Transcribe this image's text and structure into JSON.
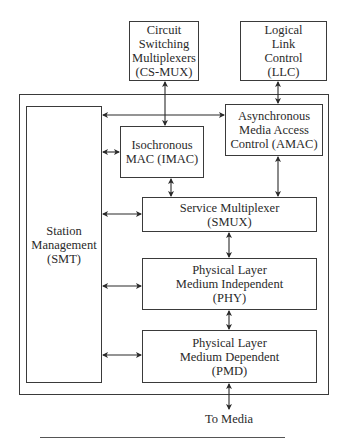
{
  "diagram": {
    "type": "block-diagram",
    "title": "",
    "external_blocks": [
      {
        "id": "cs-mux",
        "label": "Circuit\nSwitching\nMultiplexers\n(CS-MUX)"
      },
      {
        "id": "llc",
        "label": "Logical\nLink\nControl\n(LLC)"
      }
    ],
    "blocks": [
      {
        "id": "smt",
        "label": "Station\nManagement\n(SMT)"
      },
      {
        "id": "amac",
        "label": "Asynchronous\nMedia Access\nControl (AMAC)"
      },
      {
        "id": "imac",
        "label": "Isochronous\nMAC (IMAC)"
      },
      {
        "id": "smux",
        "label": "Service Multiplexer\n(SMUX)"
      },
      {
        "id": "phy",
        "label": "Physical Layer\nMedium Independent\n(PHY)"
      },
      {
        "id": "pmd",
        "label": "Physical Layer\nMedium Dependent\n(PMD)"
      }
    ],
    "output_label": "To Media",
    "connections": [
      {
        "from": "cs-mux",
        "to": "imac",
        "style": "bidirectional"
      },
      {
        "from": "llc",
        "to": "amac",
        "style": "bidirectional"
      },
      {
        "from": "smt",
        "to": "amac",
        "style": "bidirectional"
      },
      {
        "from": "smt",
        "to": "imac",
        "style": "bidirectional"
      },
      {
        "from": "imac",
        "to": "smux",
        "style": "bidirectional"
      },
      {
        "from": "amac",
        "to": "smux",
        "style": "bidirectional"
      },
      {
        "from": "smt",
        "to": "smux",
        "style": "bidirectional"
      },
      {
        "from": "smux",
        "to": "phy",
        "style": "bidirectional"
      },
      {
        "from": "smt",
        "to": "phy",
        "style": "bidirectional"
      },
      {
        "from": "phy",
        "to": "pmd",
        "style": "bidirectional"
      },
      {
        "from": "smt",
        "to": "pmd",
        "style": "bidirectional"
      },
      {
        "from": "pmd",
        "to": "media",
        "style": "bidirectional"
      }
    ]
  },
  "colors": {
    "line": "#3a3a3a",
    "background": "#ffffff"
  }
}
